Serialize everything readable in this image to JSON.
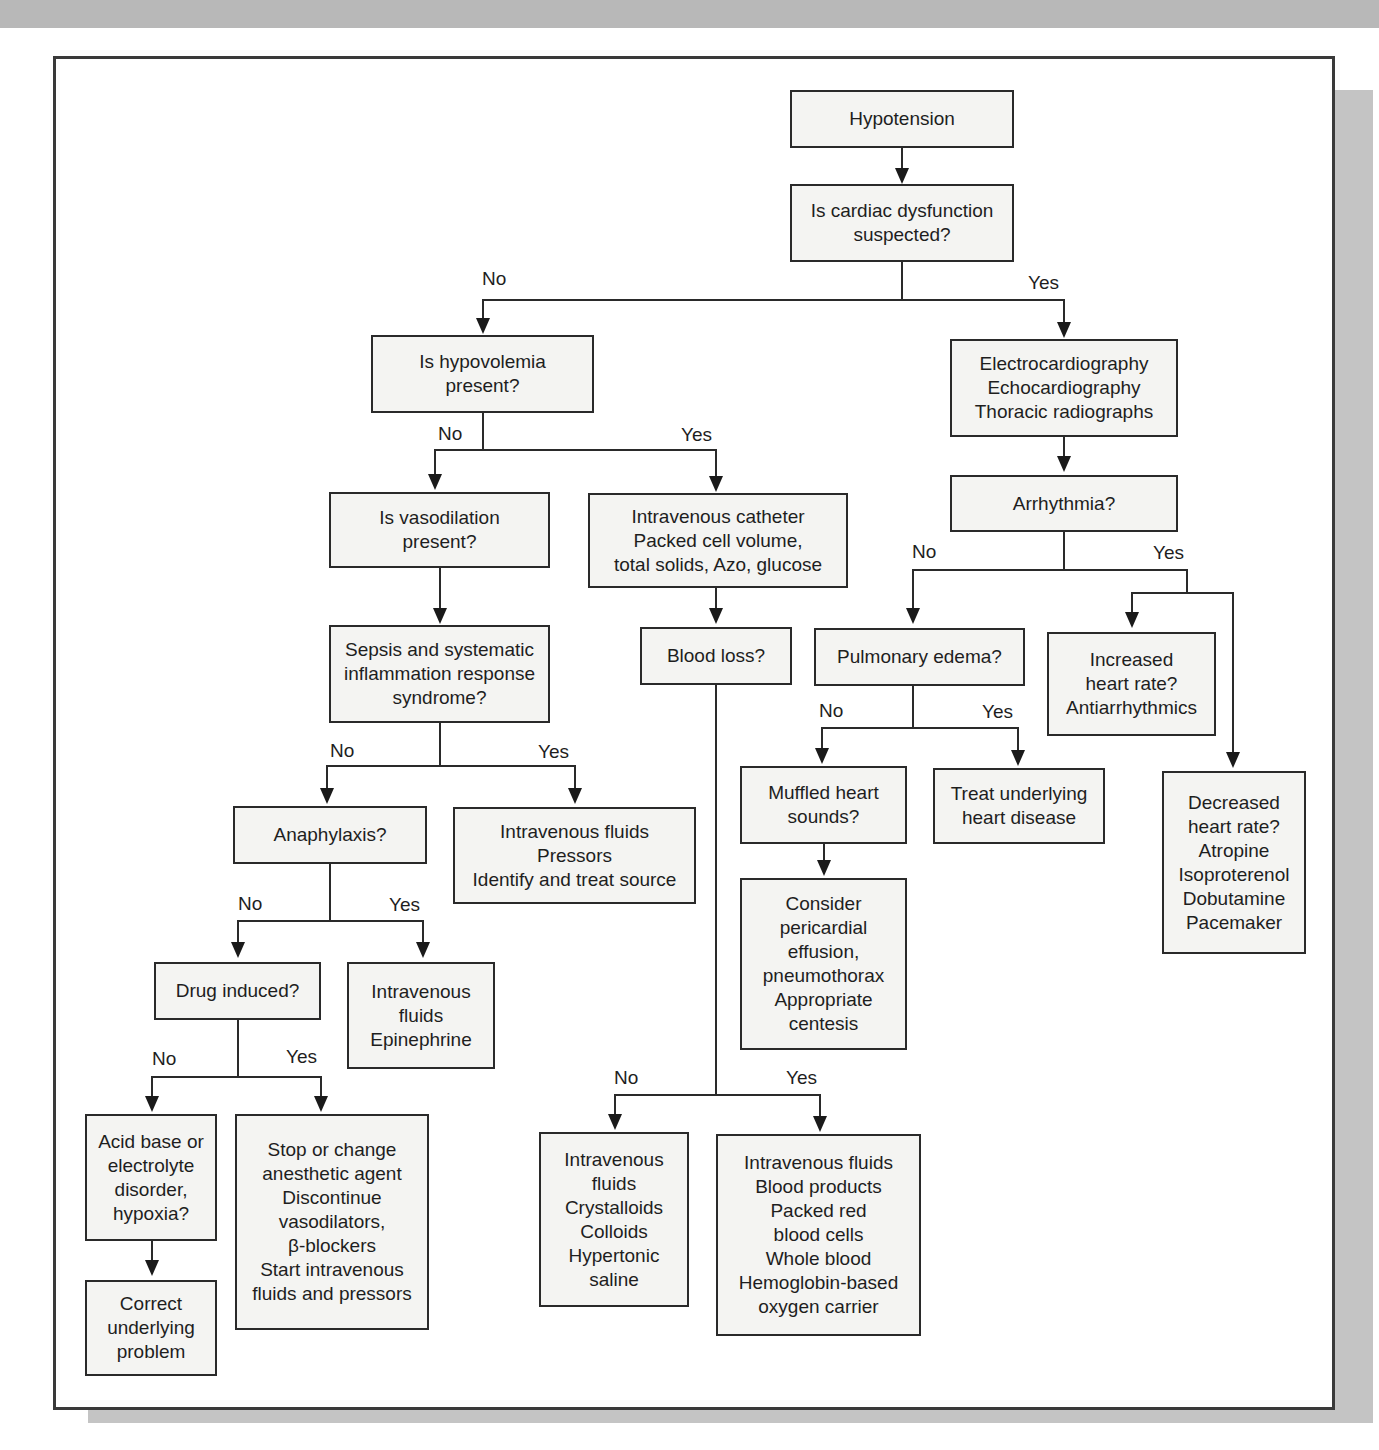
{
  "diagram": {
    "type": "flowchart",
    "title": "Hypotension",
    "nodes": {
      "hypotension": [
        "Hypotension"
      ],
      "cardiac_q": [
        "Is cardiac dysfunction",
        "suspected?"
      ],
      "hypovolemia_q": [
        "Is hypovolemia",
        "present?"
      ],
      "cardiac_tests": [
        "Electrocardiography",
        "Echocardiography",
        "Thoracic radiographs"
      ],
      "vasodilation_q": [
        "Is vasodilation",
        "present?"
      ],
      "iv_catheter": [
        "Intravenous catheter",
        "Packed cell volume,",
        "total solids, Azo, glucose"
      ],
      "arrhythmia_q": [
        "Arrhythmia?"
      ],
      "sepsis_q": [
        "Sepsis and systematic",
        "inflammation response",
        "syndrome?"
      ],
      "blood_loss_q": [
        "Blood loss?"
      ],
      "pulmonary_edema_q": [
        "Pulmonary edema?"
      ],
      "increased_hr": [
        "Increased",
        "heart rate?",
        "Antiarrhythmics"
      ],
      "anaphylaxis_q": [
        "Anaphylaxis?"
      ],
      "sepsis_treat": [
        "Intravenous fluids",
        "Pressors",
        "Identify and treat source"
      ],
      "muffled_q": [
        "Muffled heart",
        "sounds?"
      ],
      "treat_heart": [
        "Treat underlying",
        "heart disease"
      ],
      "decreased_hr": [
        "Decreased",
        "heart rate?",
        "Atropine",
        "Isoproterenol",
        "Dobutamine",
        "Pacemaker"
      ],
      "drug_q": [
        "Drug induced?"
      ],
      "anaphylaxis_treat": [
        "Intravenous",
        "fluids",
        "Epinephrine"
      ],
      "consider_effusion": [
        "Consider",
        "pericardial",
        "effusion,",
        "pneumothorax",
        "Appropriate",
        "centesis"
      ],
      "acid_base_q": [
        "Acid base or",
        "electrolyte",
        "disorder,",
        "hypoxia?"
      ],
      "stop_agent": [
        "Stop or change",
        "anesthetic agent",
        "Discontinue",
        "vasodilators,",
        "β-blockers",
        "Start intravenous",
        "fluids and pressors"
      ],
      "no_blood_loss_treat": [
        "Intravenous",
        "fluids",
        "Crystalloids",
        "Colloids",
        "Hypertonic",
        "saline"
      ],
      "blood_loss_treat": [
        "Intravenous fluids",
        "Blood products",
        "Packed red",
        "blood cells",
        "Whole blood",
        "Hemoglobin-based",
        "oxygen carrier"
      ],
      "correct_problem": [
        "Correct",
        "underlying",
        "problem"
      ]
    },
    "edge_labels": {
      "cardiac_no": "No",
      "cardiac_yes": "Yes",
      "hypovolemia_no": "No",
      "hypovolemia_yes": "Yes",
      "arrhythmia_no": "No",
      "arrhythmia_yes": "Yes",
      "sepsis_no": "No",
      "sepsis_yes": "Yes",
      "pulmonary_no": "No",
      "pulmonary_yes": "Yes",
      "anaphylaxis_no": "No",
      "anaphylaxis_yes": "Yes",
      "drug_no": "No",
      "drug_yes": "Yes",
      "blood_loss_no": "No",
      "blood_loss_yes": "Yes"
    },
    "colors": {
      "box_fill": "#f4f4f2",
      "line": "#2a2a2a",
      "frame": "#3a3a3a",
      "shadow": "#c4c4c4"
    }
  }
}
